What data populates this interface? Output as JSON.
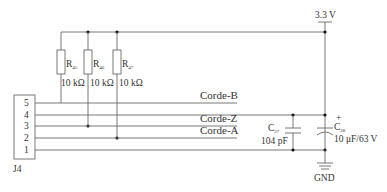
{
  "diagram": {
    "type": "circuit-schematic",
    "power": {
      "label": "3.3 V"
    },
    "ground": {
      "label": "GND"
    },
    "connector": {
      "ref": "J4",
      "pins": [
        "5",
        "4",
        "3",
        "2",
        "1"
      ]
    },
    "resistors": [
      {
        "ref": "R",
        "sub": "45",
        "value": "10 kΩ",
        "connects_pin": "5"
      },
      {
        "ref": "R",
        "sub": "46",
        "value": "10 kΩ",
        "connects_pin": "3"
      },
      {
        "ref": "R",
        "sub": "47",
        "value": "10 kΩ",
        "connects_pin": "2"
      }
    ],
    "capacitors": [
      {
        "ref": "C",
        "sub": "27",
        "value": "104 pF",
        "polarized": false
      },
      {
        "ref": "C",
        "sub": "28",
        "value": "10 μF/63 V",
        "polarized": true,
        "plus": "+"
      }
    ],
    "nets": [
      {
        "pin": "5",
        "label": "Corde-B"
      },
      {
        "pin": "4",
        "label": "3.3 V"
      },
      {
        "pin": "3",
        "label": "Corde-Z"
      },
      {
        "pin": "2",
        "label": "Corde-A"
      },
      {
        "pin": "1",
        "label": "GND"
      }
    ]
  }
}
